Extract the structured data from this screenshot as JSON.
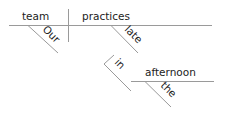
{
  "diagram": {
    "type": "sentence-diagram",
    "sentence": "Our team practices late in the afternoon",
    "subject": "team",
    "verb": "practices",
    "modifiers": {
      "subject_modifier": "Our",
      "verb_modifier_adverb": "late",
      "preposition": "in",
      "object_of_preposition": "afternoon",
      "object_modifier": "the"
    },
    "colors": {
      "line": "#9a9a9a",
      "text": "#222222",
      "background": "#ffffff"
    }
  }
}
